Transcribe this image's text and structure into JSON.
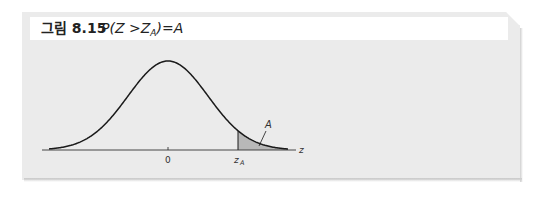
{
  "figure": {
    "caption_label": "그림 8.15",
    "caption_formula_parts": {
      "prefix": "P(Z >Z",
      "subscript": "A",
      "suffix": ")=A"
    },
    "colors": {
      "box_background": "#ebebeb",
      "title_strip": "#ffffff",
      "curve": "#1a1a1a",
      "shaded_area": "#b8b8b8"
    }
  },
  "chart_data": {
    "type": "area",
    "xlabel": "z",
    "ylabel": "",
    "x_ticks": [
      "0",
      "z_A"
    ],
    "x_tick_labels": {
      "center": "0",
      "critical_value_base": "z",
      "critical_value_subscript": "A",
      "axis_end": "z"
    },
    "shaded_region": {
      "from": "z_A",
      "to": "+inf",
      "label": "A"
    },
    "approx_z_A": 1.75,
    "xlim": [
      -3.2,
      3.3
    ],
    "grid": false,
    "legend": null
  }
}
